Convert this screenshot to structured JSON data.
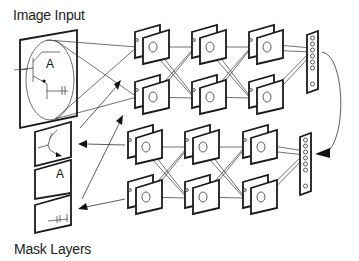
{
  "diagram": {
    "labels": {
      "image_input": "Image Input",
      "mask_layers": "Mask Layers"
    },
    "input_glyph": "A",
    "mask_glyphs": [
      "",
      "A",
      ""
    ],
    "structure": {
      "input_frame": 1,
      "mask_frames": 3,
      "top_network": {
        "columns": 3,
        "rows": 2,
        "planes_per_node": 2,
        "output_vector_units": 7
      },
      "bottom_network": {
        "columns": 3,
        "rows": 2,
        "planes_per_node": 2,
        "output_vector_units": 7
      },
      "feedback_arrow": "top output vector curves down to bottom output vector"
    },
    "colors": {
      "stroke": "#1a1a1a",
      "background": "#ffffff"
    }
  }
}
